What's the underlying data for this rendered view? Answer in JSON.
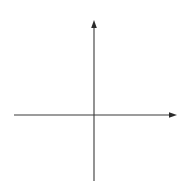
{
  "chart_data": {
    "type": "line",
    "title": "",
    "xlabel": "x",
    "ylabel": "y",
    "xlim": [
      -5,
      4.6
    ],
    "ylim": [
      -4,
      6
    ],
    "grid": true,
    "x_ticks": [
      "-4",
      "-3",
      "-2",
      "-1",
      "1",
      "2",
      "3",
      "4"
    ],
    "y_ticks": [
      "5",
      "4",
      "3",
      "2",
      "1",
      "-1",
      "-2",
      "-3"
    ],
    "series": [
      {
        "name": "y = 2x − 3",
        "equation": "y = 2x − 3",
        "slope": 2,
        "intercept": -3,
        "points": [
          {
            "x": 0,
            "y": -3
          },
          {
            "x": 2,
            "y": 1
          },
          {
            "x": 4,
            "y": 5
          }
        ]
      }
    ],
    "annotations": [
      {
        "text": "y = 2x − 3",
        "x": 2.5,
        "y": -1.5
      }
    ]
  },
  "labels": {
    "x_axis": "x",
    "y_axis": "y",
    "equation": "y = 2x − 3"
  },
  "ticks": {
    "x": [
      {
        "label": "-4",
        "value": -4
      },
      {
        "label": "-3",
        "value": -3
      },
      {
        "label": "-2",
        "value": -2
      },
      {
        "label": "-1",
        "value": -1
      },
      {
        "label": "1",
        "value": 1
      },
      {
        "label": "2",
        "value": 2
      },
      {
        "label": "3",
        "value": 3
      },
      {
        "label": "4",
        "value": 4
      }
    ],
    "y": [
      {
        "label": "5",
        "value": 5
      },
      {
        "label": "4",
        "value": 4
      },
      {
        "label": "3",
        "value": 3
      },
      {
        "label": "2",
        "value": 2
      },
      {
        "label": "1",
        "value": 1
      },
      {
        "label": "-1",
        "value": -1
      },
      {
        "label": "-2",
        "value": -2
      },
      {
        "label": "-3",
        "value": -3
      }
    ]
  },
  "colors": {
    "grid": "#c9c9c9",
    "axis": "#3a3a3a",
    "line": "#2a2a2a",
    "point": "#111111"
  }
}
